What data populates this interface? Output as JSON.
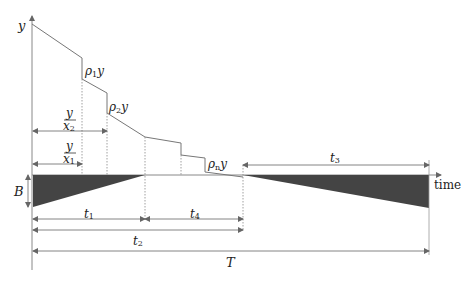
{
  "diagram": {
    "axis_labels": {
      "y_axis": "y",
      "x_axis": "time"
    },
    "curve_labels": {
      "rho1": {
        "base": "ρ",
        "sub": "1",
        "suffix": "y"
      },
      "rho2": {
        "base": "ρ",
        "sub": "2",
        "suffix": "y"
      },
      "rhon": {
        "base": "ρ",
        "sub": "n",
        "suffix": "y"
      }
    },
    "fractions": {
      "y_over_x2": {
        "numerator": "y",
        "denominator_base": "x",
        "denominator_sub": "2"
      },
      "y_over_x1": {
        "numerator": "y",
        "denominator_base": "x",
        "denominator_sub": "1"
      }
    },
    "dimension_labels": {
      "B": "B",
      "t1": {
        "base": "t",
        "sub": "1"
      },
      "t2": {
        "base": "t",
        "sub": "2"
      },
      "t3": {
        "base": "t",
        "sub": "3"
      },
      "t4": {
        "base": "t",
        "sub": "4"
      },
      "T": "T"
    },
    "colors": {
      "line": "#777777",
      "fill": "#444444",
      "text": "#222222"
    }
  }
}
